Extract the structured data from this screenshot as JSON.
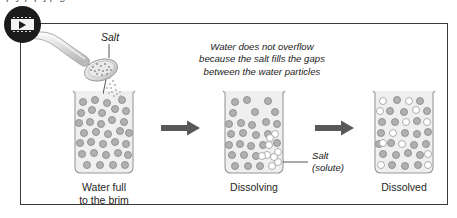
{
  "page": {
    "bleed_text_top": "p                     y              p        p        j    p     g"
  },
  "figure": {
    "video_badge": {
      "icon": "film-play-icon",
      "tooltip": "Play video"
    },
    "pourer": {
      "icon": "spoon-pouring-salt-icon",
      "label": "Salt"
    },
    "annotation": {
      "line1": "Water does not overflow",
      "line2": "because the salt fills the gaps",
      "line3": "between the water particles"
    },
    "solute_label": {
      "line1": "Salt",
      "line2": "(solute)"
    },
    "arrows": [
      {
        "icon": "arrow-right-icon",
        "color": "#595959"
      },
      {
        "icon": "arrow-right-icon",
        "color": "#595959"
      }
    ],
    "stages": [
      {
        "caption_line1": "Water full",
        "caption_line2": "to the brim",
        "water_particles": 31,
        "salt_particles": 0
      },
      {
        "caption_line1": "Dissolving",
        "caption_line2": "",
        "water_particles": 26,
        "salt_particles": 9
      },
      {
        "caption_line1": "Dissolved",
        "caption_line2": "",
        "water_particles": 23,
        "salt_particles": 12
      }
    ],
    "colors": {
      "frame_border": "#3a3a3a",
      "beaker_fill": "#efefef",
      "beaker_outline": "#9a9a9a",
      "water_particle": "#a8a8a8",
      "salt_particle": "#ffffff",
      "arrow": "#595959",
      "badge": "#1b1b1b",
      "text": "#1a1a1a"
    }
  }
}
